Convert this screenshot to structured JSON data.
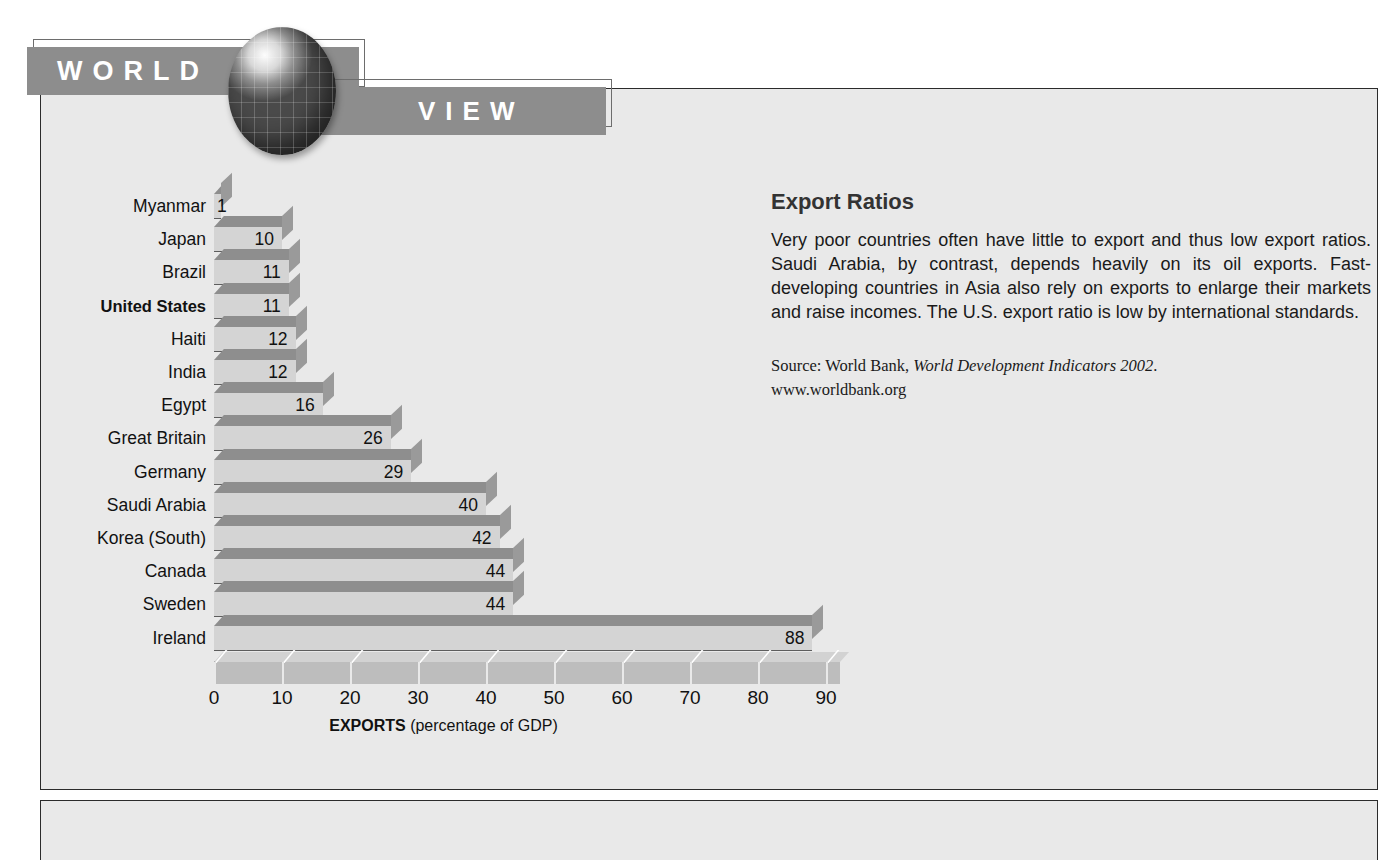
{
  "banner": {
    "world_label": "WORLD",
    "view_label": "VIEW",
    "globe_icon": "globe-icon"
  },
  "article": {
    "title": "Export Ratios",
    "body": "Very poor countries often have little to export and thus low export ratios. Saudi Arabia, by contrast, depends heavily on its oil exports. Fast-developing countries in Asia also rely on exports to enlarge their markets and raise incomes. The U.S. export ratio is low by international standards.",
    "source_prefix": "Source: World Bank, ",
    "source_italic": "World Development Indicators 2002",
    "source_suffix": ".",
    "source_url": "www.worldbank.org"
  },
  "chart_data": {
    "type": "bar",
    "orientation": "horizontal",
    "title": "Export Ratios",
    "xlabel": "EXPORTS (percentage of GDP)",
    "xlabel_bold": "EXPORTS",
    "xlabel_rest": " (percentage of GDP)",
    "ylabel": "",
    "xlim": [
      0,
      90
    ],
    "xticks": [
      0,
      10,
      20,
      30,
      40,
      50,
      60,
      70,
      80,
      90
    ],
    "grid": false,
    "legend": false,
    "highlight_category": "United States",
    "categories": [
      "Myanmar",
      "Japan",
      "Brazil",
      "United States",
      "Haiti",
      "India",
      "Egypt",
      "Great Britain",
      "Germany",
      "Saudi Arabia",
      "Korea (South)",
      "Canada",
      "Sweden",
      "Ireland"
    ],
    "values": [
      1,
      10,
      11,
      11,
      12,
      12,
      16,
      26,
      29,
      40,
      42,
      44,
      44,
      88
    ],
    "value_labels": [
      "1",
      "10",
      "11",
      "11",
      "12",
      "12",
      "16",
      "26",
      "29",
      "40",
      "42",
      "44",
      "44",
      "88"
    ],
    "colors": {
      "bar_face": "#d4d4d4",
      "bar_top": "#8e8e8e",
      "bar_side": "#9a9a9a",
      "axis_band": "#bdbdbd",
      "panel_background": "#e9e9e9",
      "banner": "#8d8d8d",
      "text": "#111111"
    }
  }
}
